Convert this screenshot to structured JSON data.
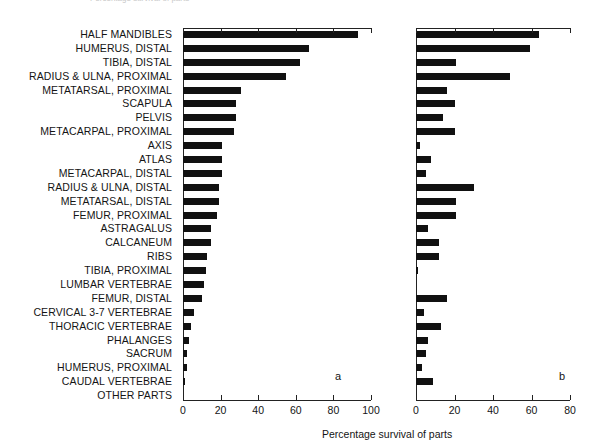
{
  "figure": {
    "top_caption_fragment": "Percentage survival of parts",
    "axis_title": "Percentage survival of parts",
    "panel_a_letter": "a",
    "panel_b_letter": "b"
  },
  "chart_data": {
    "type": "bar",
    "orientation": "horizontal",
    "title": "",
    "xlabel": "Percentage survival of parts",
    "ylabel": "",
    "grid": false,
    "legend": null,
    "panels": [
      {
        "letter": "a",
        "xlim": [
          0,
          100
        ],
        "xticks": [
          0,
          20,
          40,
          60,
          80,
          100
        ],
        "values": [
          93,
          67,
          62,
          55,
          31,
          28,
          28,
          27,
          21,
          21,
          21,
          19,
          19,
          18,
          15,
          15,
          13,
          12,
          11,
          10,
          6,
          4,
          3,
          2,
          2,
          0
        ]
      },
      {
        "letter": "b",
        "xlim": [
          0,
          80
        ],
        "xticks": [
          0,
          20,
          40,
          60,
          80
        ],
        "values": [
          64,
          59,
          21,
          49,
          16,
          20,
          14,
          20,
          2,
          8,
          5,
          30,
          21,
          21,
          6,
          12,
          12,
          1,
          0,
          16,
          4,
          13,
          6,
          5,
          3,
          9,
          11
        ]
      }
    ],
    "categories": [
      "HALF MANDIBLES",
      "HUMERUS, DISTAL",
      "TIBIA, DISTAL",
      "RADIUS & ULNA, PROXIMAL",
      "METATARSAL, PROXIMAL",
      "SCAPULA",
      "PELVIS",
      "METACARPAL, PROXIMAL",
      "AXIS",
      "ATLAS",
      "METACARPAL, DISTAL",
      "RADIUS & ULNA, DISTAL",
      "METATARSAL, DISTAL",
      "FEMUR, PROXIMAL",
      "ASTRAGALUS",
      "CALCANEUM",
      "RIBS",
      "TIBIA, PROXIMAL",
      "LUMBAR VERTEBRAE",
      "FEMUR, DISTAL",
      "CERVICAL 3-7 VERTEBRAE",
      "THORACIC VERTEBRAE",
      "PHALANGES",
      "SACRUM",
      "HUMERUS, PROXIMAL",
      "CAUDAL VERTEBRAE",
      "OTHER PARTS"
    ],
    "series": [
      {
        "name": "a",
        "xlim": [
          0,
          100
        ],
        "values": [
          93,
          67,
          62,
          55,
          31,
          28,
          28,
          27,
          21,
          21,
          21,
          19,
          19,
          18,
          15,
          15,
          13,
          12,
          11,
          10,
          6,
          4,
          3,
          2,
          2,
          1,
          0
        ]
      },
      {
        "name": "b",
        "xlim": [
          0,
          80
        ],
        "values": [
          64,
          59,
          21,
          49,
          16,
          20,
          14,
          20,
          2,
          8,
          5,
          30,
          21,
          21,
          6,
          12,
          12,
          1,
          0,
          16,
          4,
          13,
          6,
          5,
          3,
          9,
          0
        ]
      }
    ],
    "axis_ticks_a": [
      "0",
      "20",
      "40",
      "60",
      "80",
      "100"
    ],
    "axis_ticks_b": [
      "0",
      "20",
      "40",
      "60",
      "80"
    ]
  }
}
